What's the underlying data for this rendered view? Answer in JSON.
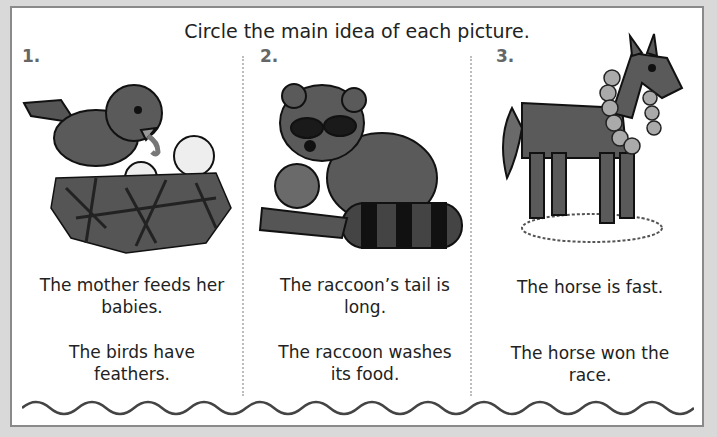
{
  "worksheet": {
    "instruction": "Circle the main idea of each picture.",
    "items": [
      {
        "number": "1.",
        "picture": "bird-feeding-babies-in-nest",
        "options": [
          "The mother feeds her babies.",
          "The birds have feathers."
        ]
      },
      {
        "number": "2.",
        "picture": "raccoon-washing-apple",
        "options": [
          "The raccoon’s tail is long.",
          "The raccoon washes its food."
        ]
      },
      {
        "number": "3.",
        "picture": "horse-with-winner-wreath",
        "options": [
          "The horse is fast.",
          "The horse won the race."
        ]
      }
    ],
    "colors": {
      "text": "#222222",
      "number": "#666666",
      "illustration_fill": "#5a5a5a",
      "border": "#8a8a8a",
      "background": "#d9d9d9"
    }
  }
}
